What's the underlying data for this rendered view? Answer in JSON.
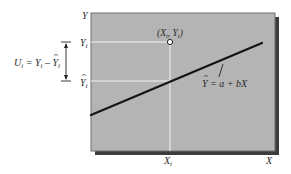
{
  "diagram": {
    "type": "regression-residual-illustration",
    "axes": {
      "y_axis_label": "Y",
      "x_axis_label": "X"
    },
    "point": {
      "label": "(X_i, Y_i)",
      "label_parts": {
        "open": "(",
        "x": "X",
        "x_sub": "i",
        "sep": ", ",
        "y": "Y",
        "y_sub": "i",
        "close": ")"
      },
      "px": 170,
      "py": 42
    },
    "y_ticks": [
      {
        "name": "observed",
        "text": "Y",
        "sub": "i",
        "hat": false,
        "py": 42
      },
      {
        "name": "fitted",
        "text": "Y",
        "sub": "i",
        "hat": true,
        "py": 81
      }
    ],
    "x_tick": {
      "text": "X",
      "sub": "i",
      "px": 170
    },
    "regression_line": {
      "label": "Y = a + bX",
      "label_parts": {
        "lhs": "Y",
        "lhs_hat": true,
        "eq": " = ",
        "a": "a",
        "plus": " + ",
        "bX": "bX"
      },
      "x1": 91,
      "y1": 115,
      "x2": 262,
      "y2": 43
    },
    "residual_annotation": {
      "label": "U_i = Y_i - Ŷ_i",
      "parts": {
        "U": "U",
        "U_sub": "i",
        "eq": " = ",
        "Y": "Y",
        "Y_sub": "i",
        "minus": " – ",
        "Yhat": "Y",
        "Yhat_sub": "i"
      }
    },
    "colors": {
      "plot_bg": "#b4b4b4",
      "plot_border": "#6e6e6e",
      "shadow": "#3c3c3c",
      "guide_lines": "#f2f2f2",
      "regression_line": "#141414",
      "text": "#2a2a2a"
    }
  }
}
